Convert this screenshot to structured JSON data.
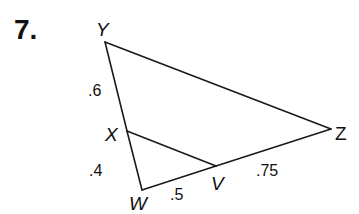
{
  "problem": {
    "number": "7."
  },
  "figure": {
    "vertices": {
      "Y": {
        "label": "Y",
        "x": 105,
        "y": 42
      },
      "X": {
        "label": "X",
        "x": 127,
        "y": 131
      },
      "W": {
        "label": "W",
        "x": 142,
        "y": 190
      },
      "V": {
        "label": "V",
        "x": 216,
        "y": 166
      },
      "Z": {
        "label": "Z",
        "x": 331,
        "y": 129
      }
    },
    "segments": [
      {
        "from": "Y",
        "to": "X",
        "length": ".6"
      },
      {
        "from": "X",
        "to": "W",
        "length": ".4"
      },
      {
        "from": "W",
        "to": "V",
        "length": ".5"
      },
      {
        "from": "V",
        "to": "Z",
        "length": ".75"
      },
      {
        "from": "Y",
        "to": "Z",
        "length": ""
      },
      {
        "from": "X",
        "to": "V",
        "length": ""
      }
    ],
    "measure_labels": {
      "YX": ".6",
      "XW": ".4",
      "WV": ".5",
      "VZ": ".75"
    }
  }
}
